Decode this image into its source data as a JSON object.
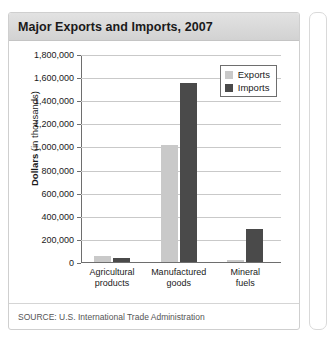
{
  "card": {
    "title": "Major Exports and Imports, 2007",
    "source": "SOURCE: U.S. International Trade Administration"
  },
  "colors": {
    "exports": "#c9c9c9",
    "imports": "#4a4a4a",
    "grid": "#c9c9c9",
    "axis": "#6e6e6e",
    "header": "#d9d9d9"
  },
  "chart_data": {
    "type": "bar",
    "title": "Major Exports and Imports, 2007",
    "xlabel": "",
    "ylabel": "Dollars (in thousands)",
    "ylabel_bold_part": "Dollars",
    "ylabel_rest": " (in thousands)",
    "categories": [
      "Agricultural products",
      "Manufactured goods",
      "Mineral fuels"
    ],
    "series": [
      {
        "name": "Exports",
        "values": [
          55000,
          1015000,
          20000
        ]
      },
      {
        "name": "Imports",
        "values": [
          35000,
          1550000,
          290000
        ]
      }
    ],
    "ylim": [
      0,
      1800000
    ],
    "ytick_step": 200000,
    "ytick_labels": [
      "1,800,000",
      "1,600,000",
      "1,400,000",
      "1,200,000",
      "1,000,000",
      "800,000",
      "600,000",
      "400,000",
      "200,000",
      "0"
    ],
    "grid": true,
    "legend_position": "top-right",
    "legend_entries": [
      "Exports",
      "Imports"
    ],
    "source": "SOURCE: U.S. International Trade Administration"
  }
}
